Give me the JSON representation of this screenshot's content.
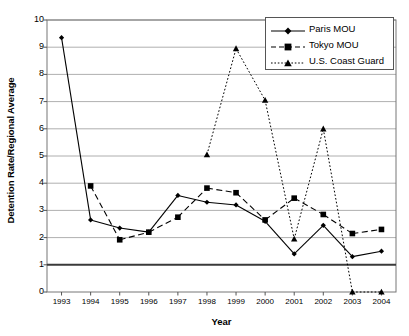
{
  "chart_data": {
    "type": "line",
    "title": "",
    "xlabel": "Year",
    "ylabel": "Detention Rate/Regional Average",
    "categories": [
      "1993",
      "1994",
      "1995",
      "1996",
      "1997",
      "1998",
      "1999",
      "2000",
      "2001",
      "2002",
      "2003",
      "2004"
    ],
    "x": [
      1993,
      1994,
      1995,
      1996,
      1997,
      1998,
      1999,
      2000,
      2001,
      2002,
      2003,
      2004
    ],
    "xlim": [
      1992.5,
      2004.5
    ],
    "ylim": [
      0,
      10
    ],
    "yticks": [
      "0",
      "1",
      "2",
      "3",
      "4",
      "5",
      "6",
      "7",
      "8",
      "9",
      "10"
    ],
    "grid": "horizontal",
    "legend_position": "top-right",
    "reference_line": {
      "value": 1,
      "style": "solid-bold"
    },
    "series": [
      {
        "name": "Paris MOU",
        "marker": "diamond",
        "line_style": "solid",
        "color": "#000000",
        "values": [
          9.35,
          2.65,
          2.35,
          2.2,
          3.55,
          3.3,
          3.2,
          2.6,
          1.4,
          2.45,
          1.3,
          1.5
        ]
      },
      {
        "name": "Tokyo MOU",
        "marker": "square",
        "line_style": "dashed",
        "color": "#000000",
        "values": [
          null,
          3.9,
          1.92,
          2.2,
          2.75,
          3.82,
          3.65,
          2.65,
          3.45,
          2.85,
          2.15,
          2.3
        ]
      },
      {
        "name": "U.S. Coast Guard",
        "marker": "triangle",
        "line_style": "dotted",
        "color": "#000000",
        "values": [
          null,
          null,
          null,
          null,
          null,
          5.05,
          8.95,
          7.05,
          1.95,
          6.0,
          0.0,
          0.0
        ]
      }
    ]
  },
  "legend": {
    "items": [
      {
        "label": "Paris MOU"
      },
      {
        "label": "Tokyo MOU"
      },
      {
        "label": "U.S. Coast Guard"
      }
    ]
  },
  "axes": {
    "x_title": "Year",
    "y_title": "Detention Rate/Regional Average"
  }
}
